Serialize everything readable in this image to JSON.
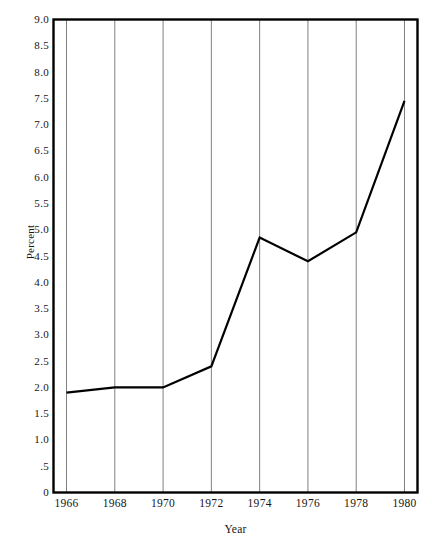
{
  "chart_data": {
    "type": "line",
    "title": "",
    "subtitle": "",
    "xlabel": "Year",
    "ylabel": "Percent",
    "x": [
      1966,
      1968,
      1970,
      1972,
      1974,
      1976,
      1978,
      1980
    ],
    "series": [
      {
        "name": "Percent",
        "values": [
          1.9,
          2.0,
          2.0,
          2.4,
          4.85,
          4.4,
          4.95,
          7.45
        ],
        "color": "#000000"
      }
    ],
    "xlim": [
      1966,
      1980
    ],
    "ylim": [
      0,
      9.0
    ],
    "xticks": [
      1966,
      1968,
      1970,
      1972,
      1974,
      1976,
      1978,
      1980
    ],
    "xtick_labels": [
      "1966",
      "1968",
      "1970",
      "1972",
      "1974",
      "1976",
      "1978",
      "1980"
    ],
    "yticks": [
      0,
      0.5,
      1.0,
      1.5,
      2.0,
      2.5,
      3.0,
      3.5,
      4.0,
      4.5,
      5.0,
      5.5,
      6.0,
      6.5,
      7.0,
      7.5,
      8.0,
      8.5,
      9.0
    ],
    "ytick_labels": [
      "0",
      ".5",
      "1.0",
      "1.5",
      "2.0",
      "2.5",
      "3.0",
      "3.5",
      "4.0",
      "4.5",
      "5.0",
      "5.5",
      "6.0",
      "6.5",
      "7.0",
      "7.5",
      "8.0",
      "8.5",
      "9.0"
    ],
    "grid": {
      "vertical": true,
      "horizontal": false,
      "color": "#808080"
    },
    "legend": {
      "visible": false,
      "position": "none",
      "entries": []
    },
    "frame": {
      "visible": true,
      "color": "#000000"
    },
    "background_color": "#ffffff",
    "annotations": []
  }
}
